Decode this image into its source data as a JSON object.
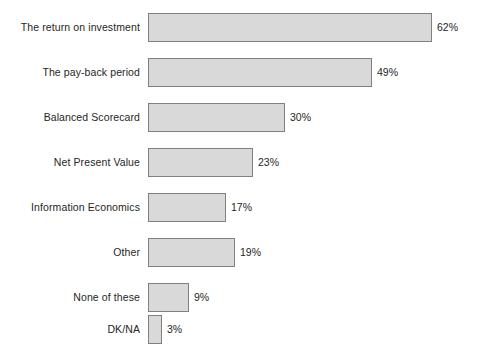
{
  "chart": {
    "title": "",
    "background_color": "#ffffff",
    "bar_fill_color": "#d9d9d9",
    "bar_border_color": "#808080",
    "label_color": "#262626"
  },
  "chart_data": {
    "type": "bar",
    "orientation": "horizontal",
    "title": "",
    "xlabel": "",
    "ylabel": "",
    "xlim": [
      0,
      62
    ],
    "grid": false,
    "legend": "none",
    "value_suffix": "%",
    "categories": [
      "The return on investment",
      "The pay-back period",
      "Balanced Scorecard",
      "Net Present Value",
      "Information Economics",
      "Other",
      "None of these",
      "DK/NA"
    ],
    "values": [
      62,
      49,
      30,
      23,
      17,
      19,
      9,
      3
    ],
    "data_labels": [
      "62%",
      "49%",
      "30%",
      "23%",
      "17%",
      "19%",
      "9%",
      "3%"
    ]
  }
}
